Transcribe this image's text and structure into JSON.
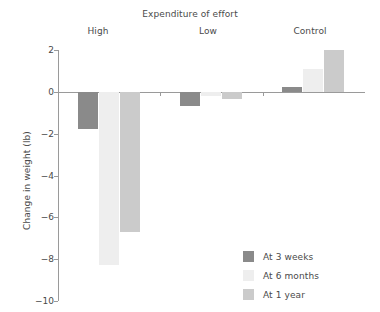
{
  "chart_data": {
    "type": "bar",
    "title": "Expenditure of effort",
    "xlabel": "",
    "ylabel": "Change in weight (lb)",
    "categories": [
      "High",
      "Low",
      "Control"
    ],
    "series": [
      {
        "name": "At 3 weeks",
        "color": "#8a8a8a",
        "values": [
          -1.8,
          -0.7,
          0.25
        ]
      },
      {
        "name": "At 6 months",
        "color": "#eeeeee",
        "values": [
          -8.3,
          -0.2,
          1.1
        ]
      },
      {
        "name": "At 1 year",
        "color": "#cbcbcb",
        "values": [
          -6.7,
          -0.35,
          2.0
        ]
      }
    ],
    "ylim": [
      -10,
      2
    ],
    "yticks": [
      2,
      0,
      -2,
      -4,
      -6,
      -8,
      -10
    ],
    "ytick_labels": [
      "2",
      "0",
      "−2",
      "−4",
      "−6",
      "−8",
      "−10"
    ],
    "grid": false,
    "legend_position": "bottom-right",
    "axis_color": "#9a9a9a",
    "text_color": "#4a4a4a",
    "background": "#ffffff"
  }
}
